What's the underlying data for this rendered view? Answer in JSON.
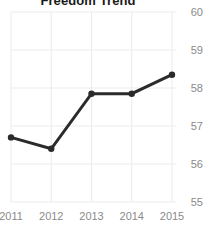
{
  "chart_data": {
    "type": "line",
    "title": "Freedom Trend",
    "xlabel": "",
    "ylabel": "",
    "categories": [
      "2011",
      "2012",
      "2013",
      "2014",
      "2015"
    ],
    "x": [
      2011,
      2012,
      2013,
      2014,
      2015
    ],
    "values": [
      56.7,
      56.4,
      57.85,
      57.85,
      58.35
    ],
    "series": [
      {
        "name": "Freedom Trend",
        "values": [
          56.7,
          56.4,
          57.85,
          57.85,
          58.35
        ]
      }
    ],
    "ylim": [
      55,
      60
    ],
    "yticks": [
      60,
      59,
      58,
      57,
      56,
      55
    ],
    "ytick_labels": [
      "60",
      "59",
      "58",
      "57",
      "56",
      "55"
    ],
    "xticks": [
      2011,
      2012,
      2013,
      2014,
      2015
    ],
    "xtick_labels": [
      "2011",
      "2012",
      "2013",
      "2014",
      "2015"
    ],
    "y_axis_position": "right",
    "grid": true,
    "grid_axis": "both",
    "legend": false,
    "legend_position": "none",
    "markers": "circle",
    "colors": {
      "line": "#2b2b2b",
      "marker": "#2b2b2b",
      "grid": "#ebebeb",
      "tick_label": "#8a8a8a",
      "title": "#1a1a1a",
      "background": "#ffffff"
    }
  }
}
